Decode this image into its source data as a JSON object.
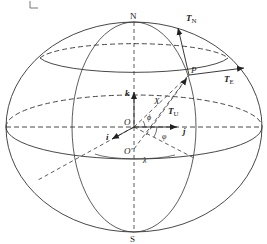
{
  "figure": {
    "corner_mark": "L",
    "labels": {
      "north": "N",
      "south": "S",
      "point": "P",
      "origin": "O",
      "origin_prime": "O'",
      "vec_X": "X",
      "axis_k": "k",
      "axis_i": "i",
      "axis_j": "j",
      "T_N": "T",
      "T_N_sub": "N",
      "T_E": "T",
      "T_E_sub": "E",
      "T_U": "T",
      "T_U_sub": "U",
      "phi_geo": "φ",
      "phi_geoc": "ϕ",
      "lambda": "λ"
    },
    "colors": {
      "line": "#333333",
      "background": "#ffffff"
    }
  }
}
